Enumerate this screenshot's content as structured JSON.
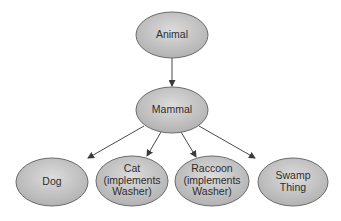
{
  "diagram": {
    "type": "class-hierarchy",
    "colors": {
      "node_fill_light": "#dcdcdc",
      "node_fill_dark": "#b2b2b2",
      "node_stroke": "#6b6b6b",
      "edge": "#4a4a4a",
      "text": "#2e2e2e",
      "background": "#ffffff"
    },
    "nodes": [
      {
        "id": "animal",
        "lines": [
          "Animal"
        ],
        "cx": 172,
        "cy": 35,
        "rx": 36,
        "ry": 23
      },
      {
        "id": "mammal",
        "lines": [
          "Mammal"
        ],
        "cx": 172,
        "cy": 110,
        "rx": 36,
        "ry": 23
      },
      {
        "id": "dog",
        "lines": [
          "Dog"
        ],
        "cx": 52,
        "cy": 182,
        "rx": 36,
        "ry": 24
      },
      {
        "id": "cat",
        "lines": [
          "Cat",
          "(implements",
          "Washer)"
        ],
        "cx": 132,
        "cy": 181,
        "rx": 36,
        "ry": 25
      },
      {
        "id": "raccoon",
        "lines": [
          "Raccoon",
          "(implements",
          "Washer)"
        ],
        "cx": 212,
        "cy": 181,
        "rx": 37,
        "ry": 25
      },
      {
        "id": "swamp-thing",
        "lines": [
          "Swamp",
          "Thing"
        ],
        "cx": 293,
        "cy": 182,
        "rx": 35,
        "ry": 24
      }
    ],
    "edges": [
      {
        "from": "animal",
        "to": "mammal",
        "x1": 172,
        "y1": 58,
        "x2": 172,
        "y2": 86
      },
      {
        "from": "mammal",
        "to": "dog",
        "x1": 144,
        "y1": 126,
        "x2": 88,
        "y2": 158
      },
      {
        "from": "mammal",
        "to": "cat",
        "x1": 161,
        "y1": 132,
        "x2": 147,
        "y2": 156
      },
      {
        "from": "mammal",
        "to": "raccoon",
        "x1": 181,
        "y1": 132,
        "x2": 196,
        "y2": 157
      },
      {
        "from": "mammal",
        "to": "swamp-thing",
        "x1": 199,
        "y1": 126,
        "x2": 255,
        "y2": 158
      }
    ]
  }
}
